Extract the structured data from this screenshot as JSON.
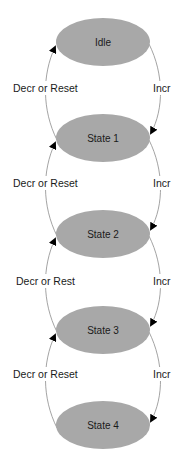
{
  "diagram": {
    "type": "state-machine",
    "colors": {
      "state_fill": "#a8a8a8",
      "edge": "#8c8c8c",
      "arrow": "#000000",
      "text": "#1a1a1a"
    },
    "states": [
      {
        "id": "idle",
        "label": "Idle"
      },
      {
        "id": "state1",
        "label": "State 1"
      },
      {
        "id": "state2",
        "label": "State 2"
      },
      {
        "id": "state3",
        "label": "State 3"
      },
      {
        "id": "state4",
        "label": "State 4"
      }
    ],
    "transitions": [
      {
        "from": "idle",
        "to": "state1",
        "label": "Incr"
      },
      {
        "from": "state1",
        "to": "idle",
        "label": "Decr or Reset"
      },
      {
        "from": "state1",
        "to": "state2",
        "label": "Incr"
      },
      {
        "from": "state2",
        "to": "state1",
        "label": "Decr or Reset"
      },
      {
        "from": "state2",
        "to": "state3",
        "label": "Incr"
      },
      {
        "from": "state3",
        "to": "state2",
        "label": "Decr or Rest"
      },
      {
        "from": "state3",
        "to": "state4",
        "label": "Incr"
      },
      {
        "from": "state4",
        "to": "state3",
        "label": "Decr or Reset"
      }
    ]
  }
}
